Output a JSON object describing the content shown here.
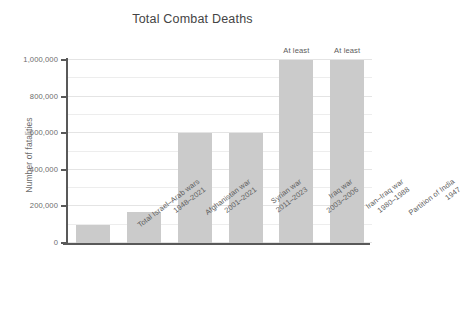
{
  "chart_data": {
    "type": "bar",
    "title": "Total Combat Deaths",
    "xlabel": "",
    "ylabel": "Number of fatalities",
    "ylim": [
      0,
      1000000
    ],
    "grid": true,
    "legend": "none",
    "categories": [
      "Total Israel–Arab wars 1948–2021",
      "Afghanistan war 2001–2021",
      "Syrian war 2011–2023",
      "Iraq war 2003–2006",
      "Iran–Iraq war 1980–1988",
      "Partition of India 1947"
    ],
    "category_lines": [
      {
        "line1": "Total Israel–Arab wars",
        "line2": "1948–2021"
      },
      {
        "line1": "Afghanistan war",
        "line2": "2001–2021"
      },
      {
        "line1": "Syrian war",
        "line2": "2011–2023"
      },
      {
        "line1": "Iraq war",
        "line2": "2003–2006"
      },
      {
        "line1": "Iran–Iraq war",
        "line2": "1980–1988"
      },
      {
        "line1": "Partition of India",
        "line2": "1947"
      }
    ],
    "values": [
      100000,
      170000,
      600000,
      600000,
      1000000,
      1000000
    ],
    "annotations": [
      "",
      "",
      "",
      "",
      "At least",
      "At least"
    ],
    "ytick_labels": [
      "0",
      "200,000",
      "400,000",
      "600,000",
      "800,000",
      "1,000,000"
    ],
    "ytick_values": [
      0,
      200000,
      400000,
      600000,
      800000,
      1000000
    ],
    "bar_color": "#cbcbcb",
    "axis_color": "#595959",
    "grid_color": "#ededed",
    "text_color": "#5c5c5c"
  }
}
